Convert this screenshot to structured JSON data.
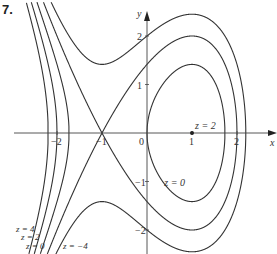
{
  "problem_number": "7.",
  "chart_data": {
    "type": "contour",
    "title": "",
    "xlabel": "x",
    "ylabel": "y",
    "x_ticks": [
      "-2",
      "-1",
      "0",
      "1",
      "2"
    ],
    "y_ticks": [
      "2",
      "1",
      "-1",
      "-2"
    ],
    "xlim": [
      -3.2,
      2.8
    ],
    "ylim": [
      -2.5,
      2.7
    ],
    "grid": false,
    "levels": [
      {
        "z": 4,
        "label": "z = 4"
      },
      {
        "z": 2,
        "label": "z = 2"
      },
      {
        "z": 0,
        "label": "z = 0"
      },
      {
        "z": -2,
        "label": ""
      },
      {
        "z": -4,
        "label": "z = −4"
      }
    ],
    "points": [
      {
        "x": 1,
        "y": 0,
        "label": "z = 2"
      }
    ],
    "saddle_point": {
      "x": -1,
      "y": 0
    },
    "inner_label": {
      "text": "z = 0",
      "x": 0.25,
      "y": -1.0
    },
    "x_axis_crossings": {
      "z=4": [
        -2.2
      ],
      "z=2": [
        -2.0
      ],
      "z=0": [
        -1.73,
        0,
        1.73
      ],
      "z=-2": [
        -1,
        2.0
      ],
      "z=-4": [
        2.2
      ]
    },
    "peak_y_on_x=1": {
      "z=0": 1.41,
      "z=-2": 2.0,
      "z=-4": 2.45
    }
  }
}
